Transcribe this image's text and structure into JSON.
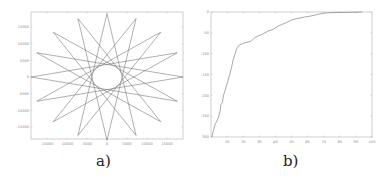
{
  "chart_data": [
    {
      "id": "a",
      "type": "line",
      "title": "",
      "caption": "a)",
      "description": "16-point star polygon {16/7} centered at origin",
      "xlabel": "",
      "ylabel": "",
      "xlim": [
        -19000,
        19000
      ],
      "ylim": [
        -19000,
        19000
      ],
      "xticks": [
        -15000,
        -10000,
        -5000,
        0,
        5000,
        10000,
        15000
      ],
      "yticks": [
        15000,
        10000,
        5000,
        0,
        -5000,
        -10000,
        -15000
      ],
      "xtick_labels": [
        "-15000",
        "-10000",
        "-5000",
        "0",
        "5000",
        "10000",
        "15000"
      ],
      "ytick_labels": [
        "15000",
        "10000",
        "5000",
        "0",
        "-5000",
        "-10000",
        "-15000"
      ],
      "star": {
        "points": 16,
        "step": 7,
        "radius": 19000,
        "center": [
          0,
          0
        ]
      },
      "grid": false,
      "line_color": "#6e6e6e"
    },
    {
      "id": "b",
      "type": "line",
      "title": "",
      "caption": "b)",
      "xlabel": "",
      "ylabel": "",
      "xlim": [
        0,
        100
      ],
      "ylim": [
        -300,
        0
      ],
      "xticks": [
        10,
        20,
        30,
        40,
        50,
        60,
        70,
        80,
        90,
        100
      ],
      "yticks": [
        0,
        -50,
        -100,
        -150,
        -200,
        -250,
        -300
      ],
      "xtick_labels": [
        "10",
        "20",
        "30",
        "40",
        "50",
        "60",
        "70",
        "80",
        "90",
        "100"
      ],
      "ytick_labels": [
        "0",
        "-50",
        "-100",
        "-150",
        "-200",
        "-250",
        "-300"
      ],
      "series": [
        {
          "name": "curve",
          "x": [
            0.5,
            1.5,
            2.5,
            3.7,
            4.5,
            5.5,
            6.2,
            7.0,
            7.8,
            8.7,
            9.5,
            10.5,
            11.8,
            12.8,
            13.7,
            14.8,
            15.8,
            16.8,
            18,
            19.5,
            21,
            23,
            25,
            27,
            29,
            31,
            33.5,
            36,
            38.5,
            41.6,
            44,
            47,
            50,
            53,
            56,
            58,
            61.5,
            64,
            67,
            70,
            73,
            76,
            79,
            82,
            85,
            88,
            91,
            94
          ],
          "y": [
            -300,
            -285,
            -270,
            -261,
            -255,
            -240,
            -222,
            -218,
            -200,
            -189,
            -178,
            -165,
            -148,
            -132,
            -116,
            -102,
            -90,
            -82,
            -79,
            -76,
            -74,
            -72,
            -70,
            -62,
            -58,
            -55,
            -50,
            -45,
            -42,
            -34,
            -30,
            -25,
            -19,
            -16,
            -14,
            -12,
            -10,
            -8,
            -5,
            -3,
            -2,
            -1.5,
            -1,
            -1,
            -0.8,
            -0.5,
            -0.3,
            0
          ]
        }
      ],
      "grid": false,
      "line_color": "#6e6e6e"
    }
  ]
}
